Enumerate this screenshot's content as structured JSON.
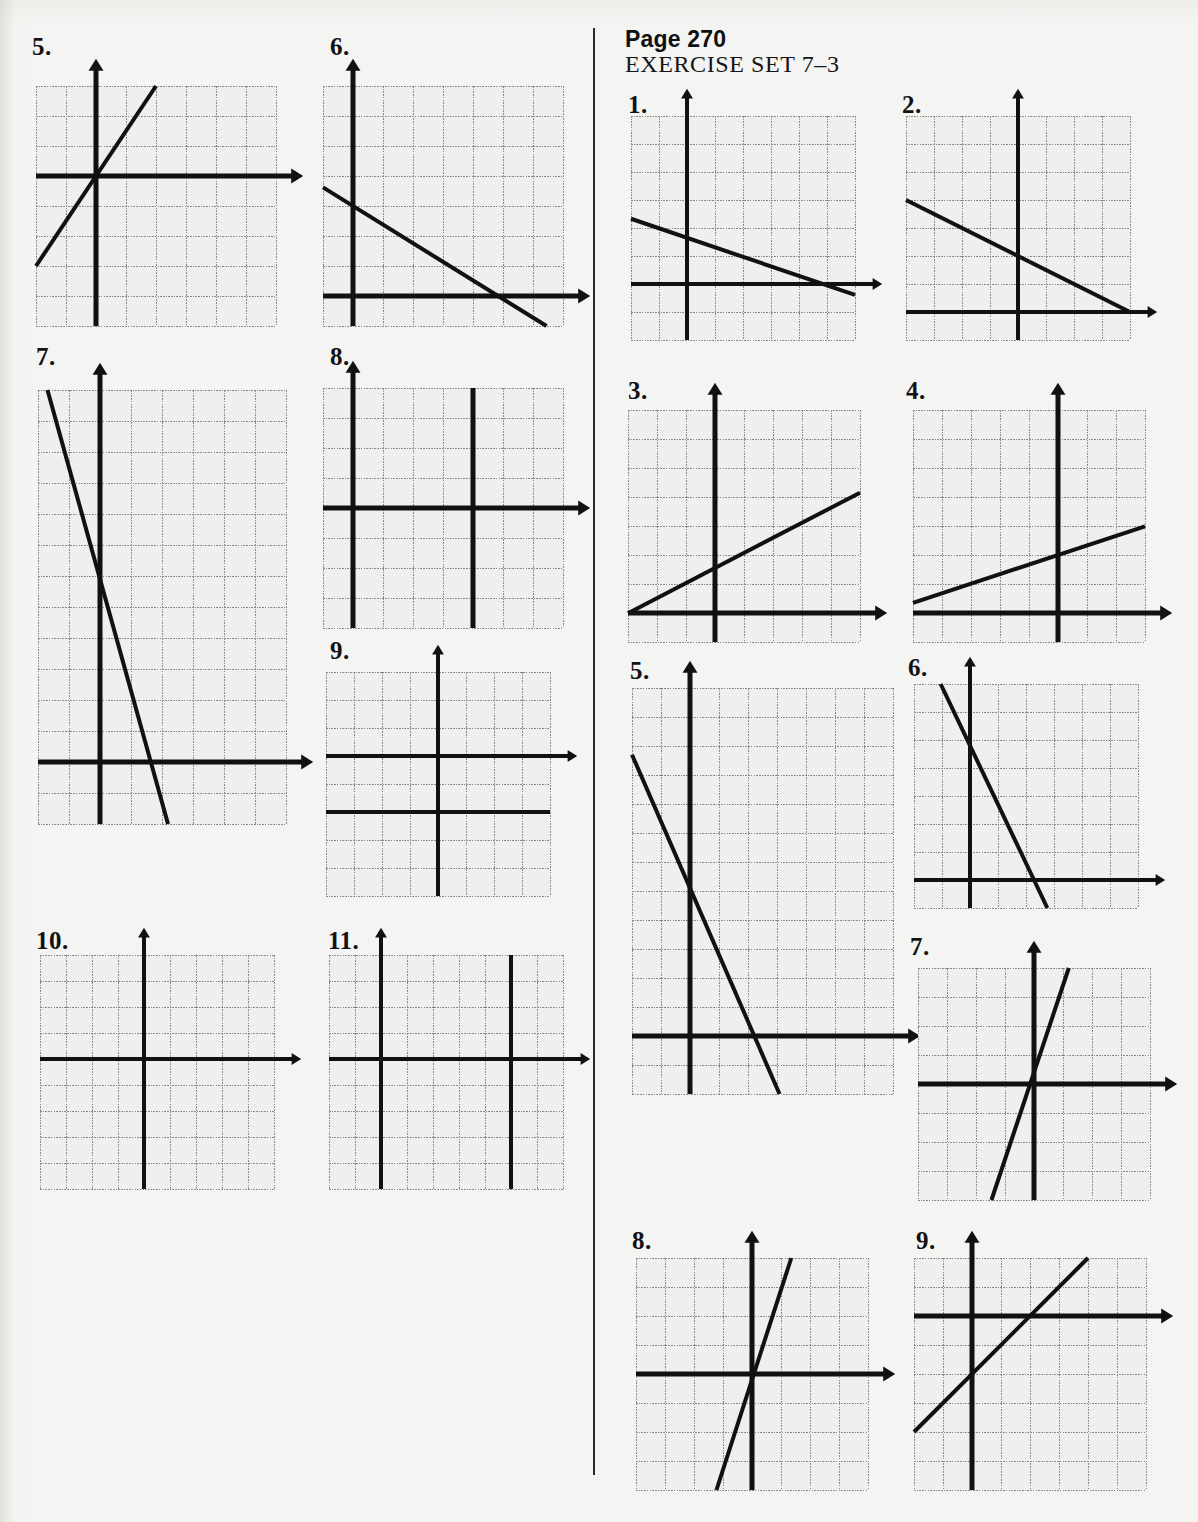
{
  "page": {
    "width": 1198,
    "height": 1522,
    "background_color": "#f4f4f2",
    "ink_color": "#111111",
    "grid_color": "#8b8b8b",
    "divider_color": "#2c2c2c"
  },
  "header": {
    "page_label": "Page 270",
    "exercise_set": "EXERCISE SET 7–3"
  },
  "divider": {
    "x": 593,
    "y": 28,
    "height": 1447
  },
  "chart_data": [
    {
      "id": "left-5",
      "type": "line",
      "label": "5.",
      "title": "",
      "cols": 8,
      "rows": 8,
      "x_axis_row": 3,
      "y_axis_col": 2,
      "xlim": [
        -2,
        6
      ],
      "ylim": [
        -5,
        3
      ],
      "grid": true,
      "x_arrow": "right",
      "y_arrow": "up",
      "series": [
        {
          "name": "line",
          "slope": 1.5,
          "intercept": 0.0,
          "kind": "oblique"
        }
      ]
    },
    {
      "id": "left-6",
      "type": "line",
      "label": "6.",
      "cols": 8,
      "rows": 8,
      "x_axis_row": 7,
      "y_axis_col": 1,
      "xlim": [
        -1,
        7
      ],
      "ylim": [
        -1,
        7
      ],
      "grid": true,
      "x_arrow": "right",
      "y_arrow": "up",
      "series": [
        {
          "name": "line",
          "slope": -0.62,
          "intercept": 3.0,
          "kind": "oblique"
        }
      ]
    },
    {
      "id": "left-7",
      "type": "line",
      "label": "7.",
      "cols": 8,
      "rows": 14,
      "x_axis_row": 12,
      "y_axis_col": 2,
      "xlim": [
        -2,
        6
      ],
      "ylim": [
        -2,
        12
      ],
      "grid": true,
      "x_arrow": "right",
      "y_arrow": "up",
      "series": [
        {
          "name": "line",
          "slope": -3.6,
          "intercept": 5.9,
          "kind": "oblique"
        }
      ]
    },
    {
      "id": "left-8",
      "type": "line",
      "label": "8.",
      "cols": 8,
      "rows": 8,
      "x_axis_row": 4,
      "y_axis_col": 1,
      "xlim": [
        -1,
        7
      ],
      "ylim": [
        -4,
        4
      ],
      "grid": true,
      "x_arrow": "right",
      "y_arrow": "up",
      "series": [
        {
          "name": "vertical-line",
          "kind": "vertical",
          "x": 4
        }
      ]
    },
    {
      "id": "left-9",
      "type": "line",
      "label": "9.",
      "cols": 8,
      "rows": 8,
      "x_axis_row": 3,
      "y_axis_col": 4,
      "xlim": [
        -4,
        4
      ],
      "ylim": [
        -5,
        3
      ],
      "grid": true,
      "x_arrow": "right",
      "y_arrow": "up",
      "series": [
        {
          "name": "horizontal-line",
          "kind": "horizontal",
          "y": -2
        }
      ]
    },
    {
      "id": "left-10",
      "type": "line",
      "label": "10.",
      "cols": 9,
      "rows": 9,
      "x_axis_row": 4,
      "y_axis_col": 4,
      "xlim": [
        -4,
        5
      ],
      "ylim": [
        -5,
        4
      ],
      "grid": true,
      "x_arrow": "right",
      "y_arrow": "up",
      "series": [
        {
          "name": "vertical-line",
          "kind": "vertical",
          "x": 0
        }
      ]
    },
    {
      "id": "left-11",
      "type": "line",
      "label": "11.",
      "cols": 9,
      "rows": 9,
      "x_axis_row": 4,
      "y_axis_col": 2,
      "xlim": [
        -2,
        7
      ],
      "ylim": [
        -5,
        4
      ],
      "grid": true,
      "x_arrow": "right",
      "y_arrow": "up",
      "series": [
        {
          "name": "vertical-line",
          "kind": "vertical",
          "x": 5
        }
      ]
    },
    {
      "id": "right-1",
      "type": "line",
      "label": "1.",
      "cols": 8,
      "rows": 8,
      "x_axis_row": 6,
      "y_axis_col": 2,
      "xlim": [
        -2,
        6
      ],
      "ylim": [
        -2,
        6
      ],
      "grid": true,
      "x_arrow": "right",
      "y_arrow": "up",
      "series": [
        {
          "name": "line",
          "slope": -0.34,
          "intercept": 1.65,
          "kind": "oblique"
        }
      ]
    },
    {
      "id": "right-2",
      "type": "line",
      "label": "2.",
      "cols": 8,
      "rows": 8,
      "x_axis_row": 7,
      "y_axis_col": 4,
      "xlim": [
        -4,
        4
      ],
      "ylim": [
        -1,
        7
      ],
      "grid": true,
      "x_arrow": "right",
      "y_arrow": "up",
      "series": [
        {
          "name": "line",
          "slope": -0.5,
          "intercept": 2.0,
          "kind": "oblique"
        }
      ]
    },
    {
      "id": "right-3",
      "type": "line",
      "label": "3.",
      "cols": 8,
      "rows": 8,
      "x_axis_row": 7,
      "y_axis_col": 3,
      "xlim": [
        -3,
        5
      ],
      "ylim": [
        -1,
        7
      ],
      "grid": true,
      "x_arrow": "right",
      "y_arrow": "up",
      "series": [
        {
          "name": "line",
          "slope": 0.52,
          "intercept": 1.55,
          "kind": "oblique"
        }
      ]
    },
    {
      "id": "right-4",
      "type": "line",
      "label": "4.",
      "cols": 8,
      "rows": 8,
      "x_axis_row": 7,
      "y_axis_col": 5,
      "xlim": [
        -5,
        3
      ],
      "ylim": [
        -1,
        7
      ],
      "grid": true,
      "x_arrow": "right",
      "y_arrow": "up",
      "series": [
        {
          "name": "line",
          "slope": 0.33,
          "intercept": 2.0,
          "kind": "oblique"
        }
      ]
    },
    {
      "id": "right-5",
      "type": "line",
      "label": "5.",
      "cols": 9,
      "rows": 14,
      "x_axis_row": 12,
      "y_axis_col": 2,
      "xlim": [
        -2,
        7
      ],
      "ylim": [
        -2,
        12
      ],
      "grid": true,
      "x_arrow": "right",
      "y_arrow": "up",
      "series": [
        {
          "name": "line",
          "slope": -2.3,
          "intercept": 5.1,
          "kind": "oblique"
        }
      ]
    },
    {
      "id": "right-6",
      "type": "line",
      "label": "6.",
      "cols": 8,
      "rows": 8,
      "x_axis_row": 7,
      "y_axis_col": 2,
      "xlim": [
        -2,
        6
      ],
      "ylim": [
        -1,
        7
      ],
      "grid": true,
      "x_arrow": "right",
      "y_arrow": "up",
      "series": [
        {
          "name": "line",
          "slope": -2.1,
          "intercept": 4.8,
          "kind": "oblique"
        }
      ]
    },
    {
      "id": "right-7",
      "type": "line",
      "label": "7.",
      "cols": 8,
      "rows": 8,
      "x_axis_row": 4,
      "y_axis_col": 4,
      "xlim": [
        -4,
        4
      ],
      "ylim": [
        -4,
        4
      ],
      "grid": true,
      "x_arrow": "right",
      "y_arrow": "up",
      "series": [
        {
          "name": "line",
          "slope": 3.0,
          "intercept": 0.4,
          "kind": "oblique"
        }
      ]
    },
    {
      "id": "right-8",
      "type": "line",
      "label": "8.",
      "cols": 8,
      "rows": 8,
      "x_axis_row": 4,
      "y_axis_col": 4,
      "xlim": [
        -4,
        4
      ],
      "ylim": [
        -4,
        4
      ],
      "grid": true,
      "x_arrow": "right",
      "y_arrow": "up",
      "series": [
        {
          "name": "line",
          "slope": 3.1,
          "intercept": -0.2,
          "kind": "oblique"
        }
      ]
    },
    {
      "id": "right-9",
      "type": "line",
      "label": "9.",
      "cols": 8,
      "rows": 8,
      "x_axis_row": 2,
      "y_axis_col": 2,
      "xlim": [
        -2,
        6
      ],
      "ylim": [
        -6,
        2
      ],
      "grid": true,
      "x_arrow": "right",
      "y_arrow": "up",
      "series": [
        {
          "name": "line",
          "slope": 1.0,
          "intercept": -2.0,
          "kind": "oblique"
        }
      ]
    }
  ],
  "layout": {
    "figures": [
      {
        "id": "left-5",
        "label_x": 32,
        "label_y": 34,
        "grid_x": 36,
        "grid_y": 86,
        "cell": 30
      },
      {
        "id": "left-6",
        "label_x": 330,
        "label_y": 34,
        "grid_x": 323,
        "grid_y": 86,
        "cell": 30
      },
      {
        "id": "left-7",
        "label_x": 36,
        "label_y": 344,
        "grid_x": 38,
        "grid_y": 390,
        "cell": 31
      },
      {
        "id": "left-8",
        "label_x": 330,
        "label_y": 344,
        "grid_x": 323,
        "grid_y": 388,
        "cell": 30
      },
      {
        "id": "left-9",
        "label_x": 330,
        "label_y": 638,
        "grid_x": 326,
        "grid_y": 672,
        "cell": 28
      },
      {
        "id": "left-10",
        "label_x": 36,
        "label_y": 928,
        "grid_x": 40,
        "grid_y": 955,
        "cell": 26
      },
      {
        "id": "left-11",
        "label_x": 328,
        "label_y": 928,
        "grid_x": 329,
        "grid_y": 955,
        "cell": 26
      },
      {
        "id": "right-1",
        "label_x": 628,
        "label_y": 92,
        "grid_x": 631,
        "grid_y": 116,
        "cell": 28
      },
      {
        "id": "right-2",
        "label_x": 902,
        "label_y": 92,
        "grid_x": 906,
        "grid_y": 116,
        "cell": 28
      },
      {
        "id": "right-3",
        "label_x": 628,
        "label_y": 378,
        "grid_x": 628,
        "grid_y": 410,
        "cell": 29
      },
      {
        "id": "right-4",
        "label_x": 906,
        "label_y": 378,
        "grid_x": 913,
        "grid_y": 410,
        "cell": 29
      },
      {
        "id": "right-5",
        "label_x": 630,
        "label_y": 658,
        "grid_x": 632,
        "grid_y": 688,
        "cell": 29
      },
      {
        "id": "right-6",
        "label_x": 908,
        "label_y": 655,
        "grid_x": 914,
        "grid_y": 684,
        "cell": 28
      },
      {
        "id": "right-7",
        "label_x": 910,
        "label_y": 934,
        "grid_x": 918,
        "grid_y": 968,
        "cell": 29
      },
      {
        "id": "right-8",
        "label_x": 632,
        "label_y": 1228,
        "grid_x": 636,
        "grid_y": 1258,
        "cell": 29
      },
      {
        "id": "right-9",
        "label_x": 916,
        "label_y": 1228,
        "grid_x": 914,
        "grid_y": 1258,
        "cell": 29
      }
    ]
  }
}
